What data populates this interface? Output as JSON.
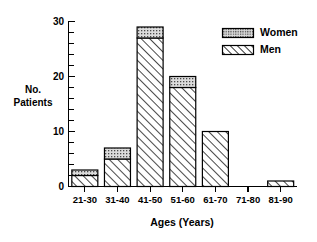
{
  "chart_data": {
    "type": "bar",
    "subtype": "stacked-bar",
    "title": "",
    "xlabel": "Ages (Years)",
    "ylabel": "No. Patients",
    "ylabel_lines": [
      "No.",
      "Patients"
    ],
    "categories": [
      "21-30",
      "31-40",
      "41-50",
      "51-60",
      "61-70",
      "71-80",
      "81-90"
    ],
    "series": [
      {
        "name": "Men",
        "values": [
          2,
          5,
          27,
          18,
          10,
          0,
          1
        ],
        "pattern": "diagonal-hatch",
        "color": "#ffffff"
      },
      {
        "name": "Women",
        "values": [
          1,
          2,
          2,
          2,
          0,
          0,
          0
        ],
        "pattern": "stipple-dots",
        "color": "#d8d8d8"
      }
    ],
    "totals": [
      3,
      7,
      29,
      20,
      10,
      0,
      1
    ],
    "ylim": [
      0,
      30
    ],
    "yticks": [
      0,
      10,
      20,
      30
    ],
    "ytick_labels": [
      "0",
      "10",
      "20",
      "30"
    ],
    "yminor_step": 2,
    "grid": false,
    "legend_position": "top-right",
    "legend_entries": [
      "Women",
      "Men"
    ]
  },
  "colors": {
    "axis": "#000000",
    "background": "#ffffff",
    "women_fill": "#d8d8d8",
    "men_fill": "#ffffff"
  }
}
